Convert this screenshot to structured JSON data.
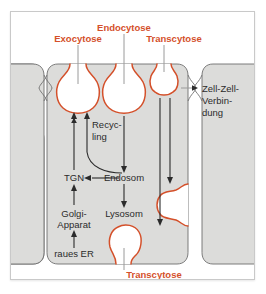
{
  "figure": {
    "type": "biology-diagram",
    "title_visible": false,
    "background_color": "#ffffff",
    "panel_background": "#ffffff",
    "cell_fill": "#dcdcda",
    "cell_stroke": "#6e6e6e",
    "vesicle_stroke": "#d4502a",
    "vesicle_fill": "#ffffff",
    "arrow_color": "#2b2b2b",
    "accent_color": "#d4502a",
    "text_color": "#2b2b2b"
  },
  "labels": {
    "endocytose": "Endocytose",
    "exocytose": "Exocytose",
    "transcytose_top": "Transcytose",
    "transcytose_bottom": "Transcytose",
    "zell_zell_line1": "Zell-Zell-",
    "zell_zell_line2": "Verbin-",
    "zell_zell_line3": "dung",
    "recycling_line1": "Recyc-",
    "recycling_line2": "ling",
    "tgn": "TGN",
    "endosom": "Endosom",
    "golgi_line1": "Golgi-",
    "golgi_line2": "Apparat",
    "lysosom": "Lysosom",
    "raues_er": "raues ER"
  },
  "structures": [
    {
      "name": "exocytose-vesicle",
      "kind": "flask-vesicle",
      "orientation": "up"
    },
    {
      "name": "endocytose-vesicle",
      "kind": "flask-vesicle",
      "orientation": "up"
    },
    {
      "name": "transcytose-apical-vesicle",
      "kind": "flask-vesicle",
      "orientation": "up"
    },
    {
      "name": "transcytose-lateral-vesicle",
      "kind": "flask-vesicle",
      "orientation": "right"
    },
    {
      "name": "transcytose-basal-vesicle",
      "kind": "flask-vesicle",
      "orientation": "down"
    },
    {
      "name": "cell-left",
      "kind": "cell-body"
    },
    {
      "name": "cell-center",
      "kind": "cell-body"
    },
    {
      "name": "cell-right",
      "kind": "cell-body"
    },
    {
      "name": "cell-junction",
      "kind": "tight-junction"
    }
  ],
  "pathways": [
    {
      "name": "tgn-to-exocytose",
      "from": "TGN",
      "to": "Exocytose vesicle",
      "style": "straight-up"
    },
    {
      "name": "endosom-to-tgn",
      "from": "Endosom",
      "to": "TGN",
      "style": "straight-left"
    },
    {
      "name": "endosom-recycling-to-exocytose",
      "from": "Endosom",
      "to": "Exocytose vesicle",
      "style": "curved-up"
    },
    {
      "name": "endocytose-to-endosom",
      "from": "Endocytose vesicle",
      "to": "Endosom",
      "style": "straight-down"
    },
    {
      "name": "endosom-to-lysosom",
      "from": "Endosom",
      "to": "Lysosom",
      "style": "straight-down"
    },
    {
      "name": "golgi-to-tgn",
      "from": "Golgi-Apparat",
      "to": "TGN",
      "style": "straight-up"
    },
    {
      "name": "raues-er-to-golgi",
      "from": "raues ER",
      "to": "Golgi-Apparat",
      "style": "straight-up"
    },
    {
      "name": "transcytose-apical-to-lateral",
      "from": "Transcytose apical vesicle",
      "to": "lateral vesicle",
      "style": "straight-down"
    },
    {
      "name": "transcytose-apical-to-basal",
      "from": "Transcytose apical vesicle",
      "to": "basal vesicle",
      "style": "straight-down-long"
    }
  ]
}
